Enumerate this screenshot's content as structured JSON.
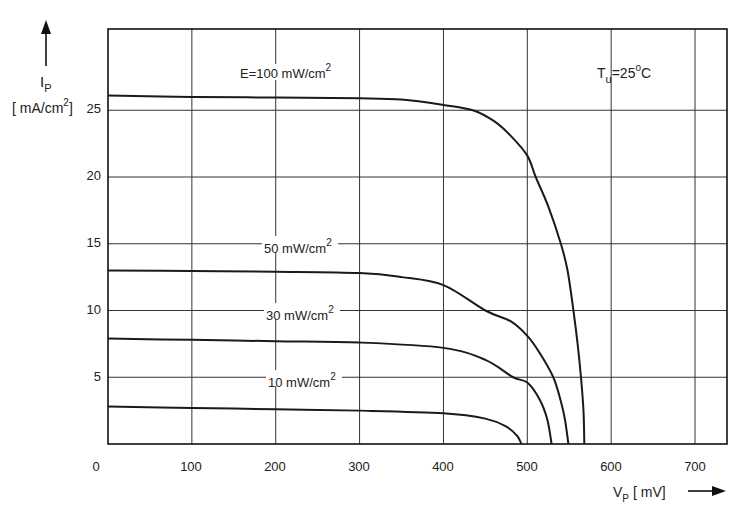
{
  "chart_data": {
    "type": "line",
    "title": "",
    "xlabel": "V_P [mV]",
    "ylabel": "I_P [mA/cm²]",
    "xlim": [
      0,
      740
    ],
    "ylim": [
      0,
      31
    ],
    "xticks": [
      0,
      100,
      200,
      300,
      400,
      500,
      600,
      700
    ],
    "yticks": [
      5,
      10,
      15,
      20,
      25
    ],
    "grid": true,
    "annotations": [
      "T_u = 25°C"
    ],
    "series": [
      {
        "name": "E = 100 mW/cm²",
        "label": "E = 100 mW/cm2",
        "points": [
          [
            0,
            26.1
          ],
          [
            100,
            26.0
          ],
          [
            200,
            25.95
          ],
          [
            300,
            25.9
          ],
          [
            350,
            25.8
          ],
          [
            400,
            25.4
          ],
          [
            435,
            25.0
          ],
          [
            460,
            24.2
          ],
          [
            480,
            23.1
          ],
          [
            500,
            21.6
          ],
          [
            510,
            20.0
          ],
          [
            525,
            17.8
          ],
          [
            540,
            15.0
          ],
          [
            548,
            13.0
          ],
          [
            555,
            10.0
          ],
          [
            560,
            7.5
          ],
          [
            564,
            5.0
          ],
          [
            567,
            2.5
          ],
          [
            568,
            0
          ]
        ]
      },
      {
        "name": "50 mW/cm²",
        "label": "50 mW/cm2",
        "points": [
          [
            0,
            13.0
          ],
          [
            100,
            12.95
          ],
          [
            200,
            12.9
          ],
          [
            300,
            12.8
          ],
          [
            350,
            12.5
          ],
          [
            400,
            11.9
          ],
          [
            450,
            10.0
          ],
          [
            480,
            9.2
          ],
          [
            500,
            8.1
          ],
          [
            515,
            6.8
          ],
          [
            531,
            5.0
          ],
          [
            540,
            3.2
          ],
          [
            545,
            1.8
          ],
          [
            549,
            0
          ]
        ]
      },
      {
        "name": "30 mW/cm²",
        "label": "30 mW/cm2",
        "points": [
          [
            0,
            7.9
          ],
          [
            100,
            7.8
          ],
          [
            200,
            7.7
          ],
          [
            300,
            7.6
          ],
          [
            400,
            7.2
          ],
          [
            450,
            6.3
          ],
          [
            483,
            5.0
          ],
          [
            500,
            4.6
          ],
          [
            515,
            3.3
          ],
          [
            524,
            1.8
          ],
          [
            529,
            0
          ]
        ]
      },
      {
        "name": "10 mW/cm²",
        "label": "10 mW/cm2",
        "points": [
          [
            0,
            2.8
          ],
          [
            100,
            2.7
          ],
          [
            200,
            2.6
          ],
          [
            300,
            2.5
          ],
          [
            400,
            2.3
          ],
          [
            450,
            1.9
          ],
          [
            475,
            1.3
          ],
          [
            488,
            0.6
          ],
          [
            493,
            0
          ]
        ]
      }
    ]
  },
  "labels": {
    "y_symbol": "I",
    "y_sub": "P",
    "y_unit": "[ mA/cm",
    "y_unit_sup": "2",
    "y_unit_close": "]",
    "x_symbol": "V",
    "x_sub": "P",
    "x_unit": "[ mV]",
    "temp_symbol": "T",
    "temp_sub": "u",
    "temp_value": "=25",
    "temp_sup": "o",
    "temp_unit": "C",
    "curve_labels": [
      {
        "text": "E=100 mW/cm",
        "sup": "2"
      },
      {
        "text": "50 mW/cm",
        "sup": "2"
      },
      {
        "text": "30 mW/cm",
        "sup": "2"
      },
      {
        "text": "10 mW/cm",
        "sup": "2"
      }
    ],
    "x_ticks": [
      "0",
      "100",
      "200",
      "300",
      "400",
      "500",
      "600",
      "700"
    ],
    "y_ticks": [
      "25",
      "20",
      "15",
      "10",
      "5"
    ]
  }
}
